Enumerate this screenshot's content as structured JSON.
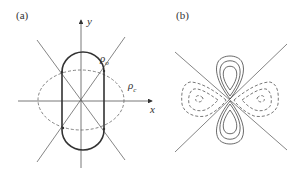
{
  "figure": {
    "panels": [
      {
        "label": "(a)",
        "axes": {
          "x_label": "x",
          "y_label": "y"
        },
        "curves": [
          {
            "name": "rho_o",
            "label": "ρo",
            "label_main": "ρ",
            "label_sub": "o",
            "style": "solid-bold",
            "shape": "stadium (vertical capsule)"
          },
          {
            "name": "rho_c",
            "label": "ρc",
            "label_main": "ρ",
            "label_sub": "c",
            "style": "dashed",
            "shape": "ellipse (horizontal)"
          }
        ],
        "lines": [
          "diagonal through origin (+)",
          "diagonal through origin (−)"
        ]
      },
      {
        "label": "(b)",
        "description": "Contour plot: solid teardrop lobes along vertical axis, dashed triangular lobes along horizontal axis, separated by two diagonal nodal lines",
        "contours": [
          {
            "lobe": "top",
            "style": "solid",
            "levels": 3
          },
          {
            "lobe": "bottom",
            "style": "solid",
            "levels": 3
          },
          {
            "lobe": "left",
            "style": "dashed",
            "levels": 3
          },
          {
            "lobe": "right",
            "style": "dashed",
            "levels": 3
          }
        ]
      }
    ],
    "colors": {
      "line": "#444444",
      "axis": "#555555",
      "text": "#333333"
    }
  }
}
